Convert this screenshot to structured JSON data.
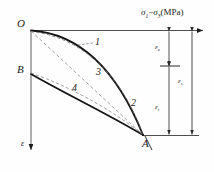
{
  "figure": {
    "type": "stress-strain-curve-diagram",
    "width": 214,
    "height": 172,
    "background": "#fefefe",
    "ink": "#1a1a1a"
  },
  "axes": {
    "horizontal": {
      "name": "sigma-axis",
      "label_sigma1": "σ",
      "label_sub1": "1",
      "label_minus": "−",
      "label_sigma3": "σ",
      "label_sub3": "3",
      "label_units": "(MPa)",
      "label_full": "σ1−σ3(MPa)",
      "direction": "right"
    },
    "vertical": {
      "name": "strain-axis",
      "label": "ε",
      "direction": "down"
    }
  },
  "points": [
    {
      "name": "point-O",
      "label": "O",
      "x": 26,
      "y": 26
    },
    {
      "name": "point-B",
      "label": "B",
      "x": 26,
      "y": 72
    },
    {
      "name": "point-A",
      "label": "A",
      "x": 143,
      "y": 135
    }
  ],
  "curves": [
    {
      "id": "1",
      "label": "1",
      "name": "curve-1",
      "style": "solid",
      "from": "O",
      "to": "A",
      "description": "upper convex curve from O to A"
    },
    {
      "id": "2",
      "label": "2",
      "name": "curve-2",
      "style": "dashed",
      "from": "O",
      "to": "A",
      "description": "dashed curve near A on upper branch"
    },
    {
      "id": "3",
      "label": "3",
      "name": "curve-3",
      "style": "dashed",
      "from": "O",
      "to": "A",
      "description": "straight dashed chord O to A"
    },
    {
      "id": "4",
      "label": "4",
      "name": "curve-4",
      "style": "solid",
      "from": "B",
      "to": "A",
      "description": "lower curve from B to A"
    }
  ],
  "dimensions": [
    {
      "name": "dim-epsilon-e",
      "label": "ε",
      "sub": "e",
      "position": "inner-upper"
    },
    {
      "name": "dim-epsilon-s",
      "label": "ε",
      "sub": "s",
      "position": "outer"
    },
    {
      "name": "dim-epsilon-t",
      "label": "ε",
      "sub": "t",
      "position": "inner-lower"
    }
  ]
}
